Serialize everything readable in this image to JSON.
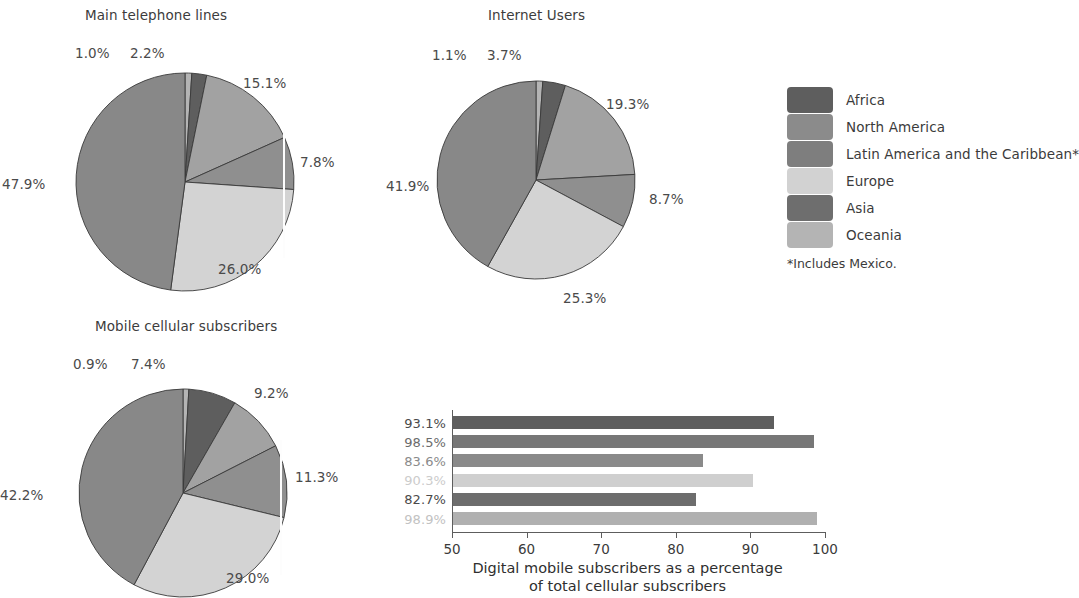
{
  "legend": {
    "note": "*Includes Mexico.",
    "items": [
      {
        "label": "Africa",
        "color": "#5e5e5e"
      },
      {
        "label": "North America",
        "color": "#8b8b8b"
      },
      {
        "label": "Latin America and the Caribbean*",
        "color": "#7e7e7e"
      },
      {
        "label": "Europe",
        "color": "#d2d2d2"
      },
      {
        "label": "Asia",
        "color": "#6e6e6e"
      },
      {
        "label": "Oceania",
        "color": "#b4b4b4"
      }
    ]
  },
  "chart_data": [
    {
      "type": "pie",
      "title": "Main telephone lines",
      "categories": [
        "Oceania",
        "Africa",
        "North America",
        "Latin America and the Caribbean*",
        "Europe",
        "Asia"
      ],
      "values": [
        1.0,
        2.2,
        15.1,
        7.8,
        26.0,
        47.9
      ],
      "labels": [
        "1.0%",
        "2.2%",
        "15.1%",
        "7.8%",
        "26.0%",
        "47.9%"
      ],
      "colors": [
        "#b4b4b4",
        "#5e5e5e",
        "#a2a2a2",
        "#8f8f8f",
        "#d3d3d3",
        "#888888"
      ],
      "units": "percent"
    },
    {
      "type": "pie",
      "title": "Internet Users",
      "categories": [
        "Oceania",
        "Africa",
        "North America",
        "Latin America and the Caribbean*",
        "Europe",
        "Asia"
      ],
      "values": [
        1.1,
        3.7,
        19.3,
        8.7,
        25.3,
        41.9
      ],
      "labels": [
        "1.1%",
        "3.7%",
        "19.3%",
        "8.7%",
        "25.3%",
        "41.9%"
      ],
      "colors": [
        "#b4b4b4",
        "#5e5e5e",
        "#a2a2a2",
        "#8f8f8f",
        "#d3d3d3",
        "#888888"
      ],
      "units": "percent"
    },
    {
      "type": "pie",
      "title": "Mobile cellular subscribers",
      "categories": [
        "Oceania",
        "Africa",
        "North America",
        "Latin America and the Caribbean*",
        "Europe",
        "Asia"
      ],
      "values": [
        0.9,
        7.4,
        9.2,
        11.3,
        29.0,
        42.2
      ],
      "labels": [
        "0.9%",
        "7.4%",
        "9.2%",
        "11.3%",
        "29.0%",
        "42.2%"
      ],
      "colors": [
        "#b4b4b4",
        "#5e5e5e",
        "#a2a2a2",
        "#8f8f8f",
        "#d3d3d3",
        "#888888"
      ],
      "units": "percent"
    },
    {
      "type": "bar",
      "orientation": "horizontal",
      "title": "",
      "xlabel": "Digital mobile subscribers as a percentage of total cellular subscribers",
      "xlabel_line1": "Digital mobile subscribers as a percentage",
      "xlabel_line2": "of total cellular subscribers",
      "ylabel": "",
      "xlim": [
        50,
        100
      ],
      "xticks": [
        "50",
        "60",
        "70",
        "80",
        "90",
        "100"
      ],
      "grid": false,
      "categories": [
        "Africa",
        "North America",
        "Latin America and the Caribbean*",
        "Europe",
        "Asia",
        "Oceania"
      ],
      "values": [
        93.1,
        98.5,
        83.6,
        90.3,
        82.7,
        98.9
      ],
      "labels": [
        "93.1%",
        "98.5%",
        "83.6%",
        "90.3%",
        "82.7%",
        "98.9%"
      ],
      "colors": [
        "#5e5e5e",
        "#777777",
        "#8a8a8a",
        "#cfcfcf",
        "#6d6d6d",
        "#b0b0b0"
      ],
      "label_colors": [
        "#4a4a4a",
        "#6b6b6b",
        "#8a8a8a",
        "#cccccc",
        "#4a4a4a",
        "#c2c2c2"
      ]
    }
  ],
  "pie_label_positions": {
    "chart0": [
      {
        "text": "1.0%",
        "x": 75,
        "y": 47
      },
      {
        "text": "2.2%",
        "x": 130,
        "y": 47
      },
      {
        "text": "15.1%",
        "x": 243,
        "y": 77
      },
      {
        "text": "7.8%",
        "x": 300,
        "y": 156
      },
      {
        "text": "26.0%",
        "x": 218,
        "y": 263
      },
      {
        "text": "47.9%",
        "x": 2,
        "y": 178
      }
    ],
    "chart1": [
      {
        "text": "1.1%",
        "x": 432,
        "y": 49
      },
      {
        "text": "3.7%",
        "x": 487,
        "y": 49
      },
      {
        "text": "19.3%",
        "x": 606,
        "y": 98
      },
      {
        "text": "8.7%",
        "x": 649,
        "y": 193
      },
      {
        "text": "25.3%",
        "x": 563,
        "y": 292
      },
      {
        "text": "41.9%",
        "x": 386,
        "y": 180
      }
    ],
    "chart2": [
      {
        "text": "0.9%",
        "x": 73,
        "y": 358
      },
      {
        "text": "7.4%",
        "x": 131,
        "y": 358
      },
      {
        "text": "9.2%",
        "x": 254,
        "y": 387
      },
      {
        "text": "11.3%",
        "x": 295,
        "y": 471
      },
      {
        "text": "29.0%",
        "x": 226,
        "y": 572
      },
      {
        "text": "42.2%",
        "x": 0,
        "y": 489
      }
    ]
  },
  "pie_titles": [
    {
      "text": "Main telephone lines",
      "x": 85,
      "y": 9
    },
    {
      "text": "Internet Users",
      "x": 488,
      "y": 9
    },
    {
      "text": "Mobile cellular subscribers",
      "x": 95,
      "y": 320
    }
  ]
}
